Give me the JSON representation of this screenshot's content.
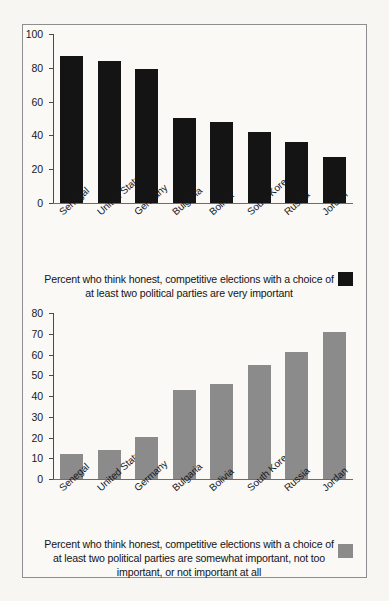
{
  "figure": {
    "background_color": "#faf9f6",
    "page_color": "#f7f6f2",
    "border_color": "#8e8e90"
  },
  "chart_data": [
    {
      "id": "very-important",
      "type": "bar",
      "title": "",
      "xlabel": "",
      "ylabel": "",
      "ylim": [
        0,
        100
      ],
      "ytick_step": 20,
      "yticks": [
        0,
        20,
        40,
        60,
        80,
        100
      ],
      "grid": false,
      "legend_position": "below-right",
      "bar_color": "#141414",
      "categories": [
        "Senegal",
        "United States",
        "Germany",
        "Bulgaria",
        "Bolivia",
        "South Korea",
        "Russia",
        "Jordan"
      ],
      "values": [
        87,
        84,
        79,
        50,
        48,
        42,
        36,
        27
      ],
      "caption": "Percent who think honest, competitive elections with a choice of at least two political parties are very important"
    },
    {
      "id": "somewhat-or-less-important",
      "type": "bar",
      "title": "",
      "xlabel": "",
      "ylabel": "",
      "ylim": [
        0,
        80
      ],
      "ytick_step": 10,
      "yticks": [
        0,
        10,
        20,
        30,
        40,
        50,
        60,
        70,
        80
      ],
      "grid": false,
      "legend_position": "below-right",
      "bar_color": "#8b8b8b",
      "categories": [
        "Senegal",
        "United States",
        "Germany",
        "Bulgaria",
        "Bolivia",
        "South Korea",
        "Russia",
        "Jordan"
      ],
      "values": [
        12,
        14,
        20,
        43,
        46,
        55,
        61,
        71
      ],
      "caption": "Percent who think honest, competitive elections with a choice of at least two political parties are somewhat important, not too important, or not important at all"
    }
  ]
}
